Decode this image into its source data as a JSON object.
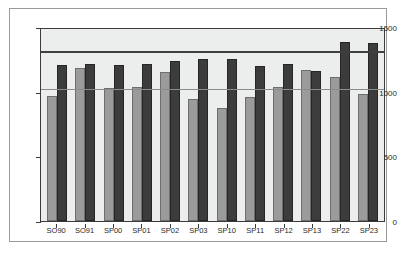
{
  "chart_data": {
    "type": "bar",
    "title": "",
    "subtitle": "",
    "xlabel": "",
    "ylabel": "",
    "ylim": [
      0,
      1500
    ],
    "yticks": [
      0,
      500,
      1000,
      1500
    ],
    "ytick_labels": [
      "0",
      "500",
      "1000",
      "1500"
    ],
    "grid": false,
    "legend": "none",
    "categories": [
      "SO90",
      "SO91",
      "SP00",
      "SP01",
      "SP02",
      "SP03",
      "SP10",
      "SP11",
      "SP12",
      "SP13",
      "SP22",
      "SP23"
    ],
    "series": [
      {
        "name": "light-series",
        "color": "#9b9b9b",
        "values": [
          965,
          1180,
          1030,
          1040,
          1155,
          940,
          875,
          960,
          1040,
          1170,
          1110,
          985
        ]
      },
      {
        "name": "dark-series",
        "color": "#3c3c3c",
        "values": [
          1205,
          1215,
          1210,
          1215,
          1240,
          1250,
          1250,
          1195,
          1215,
          1160,
          1385,
          1375
        ]
      }
    ],
    "reference_lines": [
      {
        "name": "upper-reference-line",
        "value": 1330,
        "color": "#3f3f3f"
      },
      {
        "name": "lower-reference-line",
        "value": 1035,
        "color": "#8b8b8b"
      }
    ]
  }
}
